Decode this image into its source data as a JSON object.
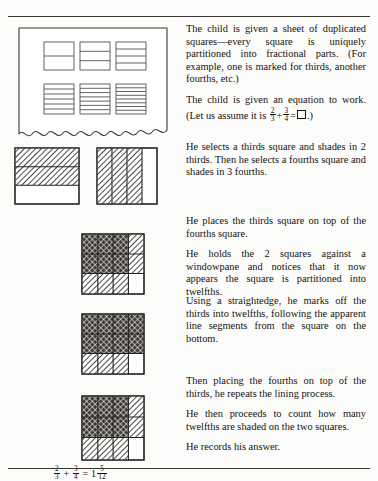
{
  "document": {
    "type": "textbook-figure",
    "title": "Child fraction addition procedure with partitioned squares",
    "equation_prompt": "2/3 + 3/4 = box",
    "equation_answer": "2/3 + 3/4 = 1 5/12"
  },
  "text_blocks": [
    {
      "id": "block-1",
      "paragraphs": [
        "The child is given a sheet of duplicated squares—every square is uniquely partitioned into fractional parts. (For example, one is marked for thirds, another fourths, etc.)",
        "The child is given an equation to work."
      ],
      "equation_sentence_prefix": "(Let us assume it is ",
      "equation_sentence_suffix": ".)"
    },
    {
      "id": "block-2",
      "paragraphs": [
        "He selects a thirds square and shades in 2 thirds. Then he selects a fourths square and shades in 3 fourths."
      ]
    },
    {
      "id": "block-3",
      "paragraphs": [
        "He places the thirds square on top of the fourths square.",
        "He holds the 2 squares against a windowpane and notices that it now appears the square is partitioned into twelfths."
      ]
    },
    {
      "id": "block-4",
      "paragraphs": [
        "Using a straightedge, he marks off the thirds into twelfths, following the apparent line segments from the square on the bottom."
      ]
    },
    {
      "id": "block-5",
      "paragraphs": [
        "Then placing the fourths on top of the thirds, he repeats the lining process.",
        "He then proceeds to count how many twelfths are shaded on the two squares.",
        "He records his answer."
      ]
    }
  ],
  "fractions": {
    "two_thirds": {
      "numerator": "2",
      "denominator": "3"
    },
    "three_fourths": {
      "numerator": "3",
      "denominator": "4"
    },
    "five_twelfths": {
      "numerator": "5",
      "denominator": "12"
    },
    "whole": "1",
    "plus": "+",
    "equals": "="
  },
  "figures": {
    "sheet": {
      "label": "sheet-of-duplicated-squares",
      "squares": [
        {
          "name": "halves",
          "divisions": 2,
          "orientation": "horizontal"
        },
        {
          "name": "thirds",
          "divisions": 3,
          "orientation": "horizontal"
        },
        {
          "name": "fourths",
          "divisions": 4,
          "orientation": "horizontal"
        },
        {
          "name": "sixths",
          "divisions": 6,
          "orientation": "horizontal"
        },
        {
          "name": "sevenths",
          "divisions": 7,
          "orientation": "horizontal"
        },
        {
          "name": "eighths",
          "divisions": 8,
          "orientation": "horizontal"
        }
      ],
      "edge": "torn-wavy-bottom"
    },
    "thirds_shaded": {
      "label": "thirds-square-two-thirds-shaded",
      "divisions": 3,
      "orientation": "horizontal",
      "shaded_count": 2,
      "fill": "diagonal-hatch"
    },
    "fourths_shaded": {
      "label": "fourths-square-three-fourths-shaded",
      "divisions": 4,
      "orientation": "vertical",
      "shaded_count": 3,
      "fill": "diagonal-hatch"
    },
    "overlay_twelfths": {
      "label": "overlay-thirds-on-fourths",
      "rows": 3,
      "cols": 4,
      "double_shaded_cells": 6,
      "single_shaded_cells": 5,
      "unshaded_cells": 1
    },
    "marked_twelfths": {
      "label": "thirds-marked-into-twelfths",
      "rows": 3,
      "cols": 4,
      "double_shaded_cells": 8,
      "single_shaded_cells": 3,
      "unshaded_cells": 1
    },
    "final_count": {
      "label": "final-twelfths-count",
      "rows": 3,
      "cols": 4,
      "double_shaded_cells": 6,
      "single_shaded_cells": 5,
      "unshaded_cells": 1,
      "total_twelfths_shaded": "17"
    }
  },
  "colors": {
    "ink": "#15130f",
    "line": "#3a3733",
    "paper": "#fcfcfa",
    "hatch": "#2b2825"
  }
}
